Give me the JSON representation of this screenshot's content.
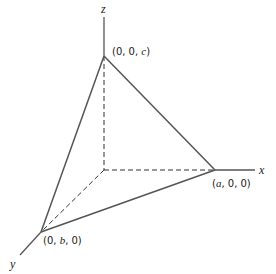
{
  "diagram": {
    "type": "3d-coordinate-tetrahedron",
    "axes": {
      "x": {
        "label": "x"
      },
      "y": {
        "label": "y"
      },
      "z": {
        "label": "z"
      }
    },
    "vertices": {
      "x_intercept": {
        "prefix": "(",
        "var": "a",
        "suffix": ", 0, 0)"
      },
      "y_intercept": {
        "prefix": "(0, ",
        "var": "b",
        "suffix": ", 0)"
      },
      "z_intercept": {
        "prefix": "(0, 0, ",
        "var": "c",
        "suffix": ")"
      }
    },
    "colors": {
      "solid_edge": "#555555",
      "dashed_axis": "#333333",
      "text": "#1a1a1a"
    }
  }
}
